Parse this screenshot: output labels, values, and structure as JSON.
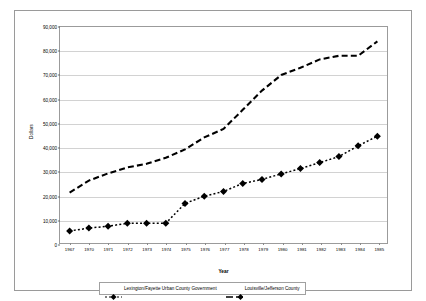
{
  "chart_data": {
    "type": "line",
    "title": "",
    "xlabel": "Year",
    "ylabel": "Dollars",
    "x": [
      1967,
      1970,
      1971,
      1972,
      1973,
      1974,
      1975,
      1976,
      1977,
      1978,
      1979,
      1980,
      1981,
      1982,
      1983,
      1984,
      1985
    ],
    "categories": [
      "1967",
      "1970",
      "1971",
      "1972",
      "1973",
      "1974",
      "1975",
      "1976",
      "1977",
      "1978",
      "1979",
      "1980",
      "1981",
      "1982",
      "1983",
      "1984",
      "1985"
    ],
    "ylim": [
      0,
      90000
    ],
    "ytick_values": [
      0,
      10000,
      20000,
      30000,
      40000,
      50000,
      60000,
      70000,
      80000,
      90000
    ],
    "ytick_labels": [
      "0",
      "10,000",
      "20,000",
      "30,000",
      "40,000",
      "50,000",
      "60,000",
      "70,000",
      "80,000",
      "90,000"
    ],
    "grid": true,
    "legend_position": "bottom",
    "series": [
      {
        "name": "Lexington/Fayette Urban County Government",
        "marker": "diamond",
        "linestyle": "dotted",
        "color": "#000000",
        "values": [
          5000,
          6200,
          7000,
          8200,
          8200,
          8200,
          16500,
          19500,
          21500,
          24800,
          26500,
          28800,
          31000,
          33500,
          36000,
          40500,
          44500
        ]
      },
      {
        "name": "Louisville/Jefferson County",
        "marker": "none",
        "linestyle": "dashed",
        "color": "#000000",
        "values": [
          21000,
          26000,
          29000,
          31500,
          33000,
          35500,
          39000,
          44000,
          47500,
          55500,
          63500,
          70000,
          73000,
          76500,
          78000,
          78000,
          84000
        ]
      }
    ]
  }
}
